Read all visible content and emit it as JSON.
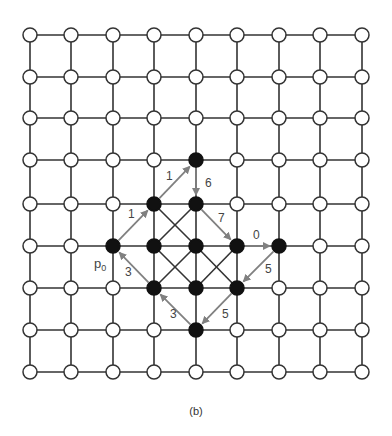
{
  "figure": {
    "caption": "(b)",
    "grid": {
      "cols": 9,
      "rows": 9,
      "x_centers": [
        30,
        71,
        113,
        154,
        196,
        237,
        279,
        320,
        362
      ],
      "y_centers": [
        35,
        77,
        118,
        160,
        204,
        246,
        288,
        330,
        372
      ],
      "node_radius": 7,
      "line_color": "#333333",
      "open_node_fill": "#ffffff",
      "filled_node_color": "#111111"
    },
    "filled_nodes": [
      [
        4,
        3
      ],
      [
        3,
        4
      ],
      [
        4,
        4
      ],
      [
        2,
        5
      ],
      [
        3,
        5
      ],
      [
        4,
        5
      ],
      [
        5,
        5
      ],
      [
        6,
        5
      ],
      [
        3,
        6
      ],
      [
        4,
        6
      ],
      [
        5,
        6
      ],
      [
        4,
        7
      ]
    ],
    "black_diagonals": [
      [
        [
          3,
          4
        ],
        [
          4,
          5
        ]
      ],
      [
        [
          4,
          4
        ],
        [
          3,
          5
        ]
      ],
      [
        [
          3,
          5
        ],
        [
          4,
          6
        ]
      ],
      [
        [
          4,
          5
        ],
        [
          3,
          6
        ]
      ],
      [
        [
          4,
          5
        ],
        [
          5,
          6
        ]
      ],
      [
        [
          5,
          5
        ],
        [
          4,
          6
        ]
      ]
    ],
    "arrow_color": "#808080",
    "arrows": [
      {
        "from": [
          2,
          5
        ],
        "to": [
          3,
          4
        ],
        "label": "1",
        "label_pos": [
          128,
          218
        ]
      },
      {
        "from": [
          3,
          4
        ],
        "to": [
          4,
          3
        ],
        "label": "1",
        "label_pos": [
          166,
          180
        ]
      },
      {
        "from": [
          4,
          3
        ],
        "to": [
          4,
          4
        ],
        "label": "6",
        "label_pos": [
          205,
          187
        ]
      },
      {
        "from": [
          4,
          4
        ],
        "to": [
          5,
          5
        ],
        "label": "7",
        "label_pos": [
          218,
          222
        ]
      },
      {
        "from": [
          5,
          5
        ],
        "to": [
          6,
          5
        ],
        "label": "0",
        "label_pos": [
          253,
          239
        ]
      },
      {
        "from": [
          6,
          5
        ],
        "to": [
          5,
          6
        ],
        "label": "5",
        "label_pos": [
          265,
          273
        ]
      },
      {
        "from": [
          5,
          6
        ],
        "to": [
          4,
          7
        ],
        "label": "5",
        "label_pos": [
          222,
          318
        ]
      },
      {
        "from": [
          4,
          7
        ],
        "to": [
          3,
          6
        ],
        "label": "3",
        "label_pos": [
          170,
          318
        ]
      },
      {
        "from": [
          3,
          6
        ],
        "to": [
          2,
          5
        ],
        "label": "3",
        "label_pos": [
          125,
          276
        ]
      }
    ],
    "start_label": {
      "text": "p",
      "subscript": "0",
      "pos": [
        94,
        268
      ]
    }
  }
}
